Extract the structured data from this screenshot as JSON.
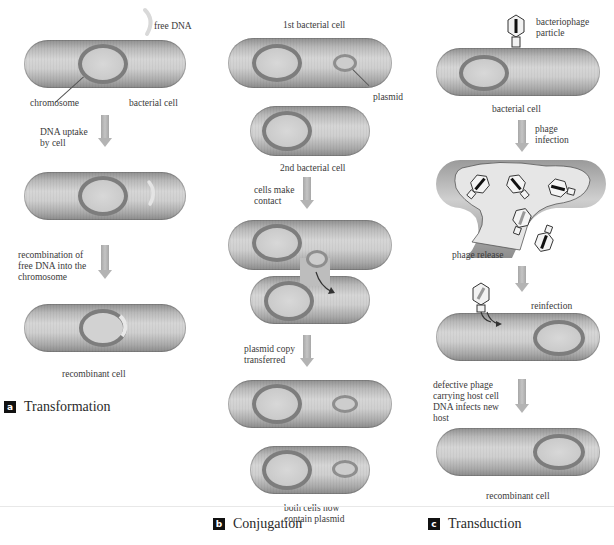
{
  "figure": {
    "panels": [
      {
        "id": "a",
        "badge": "a",
        "title": "Transformation",
        "labels": {
          "free_dna": "free DNA",
          "chromosome": "chromosome",
          "bacterial_cell": "bacterial cell",
          "step1": "DNA uptake\nby cell",
          "step2": "recombination of\nfree DNA into the\nchromosome",
          "result": "recombinant cell"
        }
      },
      {
        "id": "b",
        "badge": "b",
        "title": "Conjugation",
        "labels": {
          "first_cell": "1st bacterial cell",
          "plasmid": "plasmid",
          "second_cell": "2nd bacterial cell",
          "step1": "cells make\ncontact",
          "step2": "plasmid copy\ntransferred",
          "result": "both cells now\ncontain plasmid"
        }
      },
      {
        "id": "c",
        "badge": "c",
        "title": "Transduction",
        "labels": {
          "phage_particle": "bacteriophage\nparticle",
          "bacterial_cell": "bacterial cell",
          "step1": "phage\ninfection",
          "phage_release": "phage release",
          "reinfection": "reinfection",
          "step2": "defective phage\ncarrying host cell\nDNA infects new\nhost",
          "result": "recombinant cell"
        }
      }
    ],
    "colors": {
      "cell_fill": "#c8c8c8",
      "chromosome": "#7d7d7d",
      "arrow": "#b3b3b3",
      "badge": "#111111",
      "free_dna": "#e0e0e0"
    }
  }
}
